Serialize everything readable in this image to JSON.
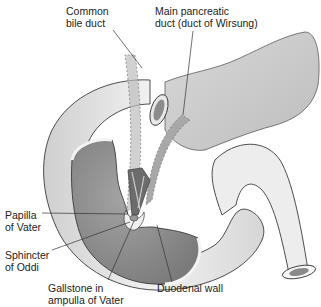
{
  "diagram": {
    "palette": {
      "background": "#ffffff",
      "outline": "#3a3a3a",
      "duodenum_outer": "#e6e6e6",
      "duodenum_inner": "#8e8e8e",
      "pancreas": "#cfcfcf",
      "duct": "#a8a8a8",
      "leader_line": "#333333",
      "text": "#222222"
    },
    "labels": {
      "common_bile_duct": "Common\nbile duct",
      "main_pancreatic_duct": "Main pancreatic\nduct (duct of Wirsung)",
      "papilla_of_vater": "Papilla\nof Vater",
      "sphincter_of_oddi": "Sphincter\nof Oddi",
      "gallstone": "Gallstone in\nampulla of Vater",
      "duodenal_wall": "Duodenal wall"
    }
  }
}
